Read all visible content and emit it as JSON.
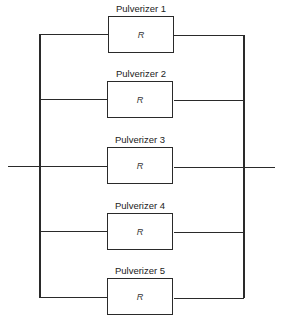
{
  "diagram": {
    "type": "parallel-reliability-block-diagram",
    "blocks": [
      {
        "label": "Pulverizer 1",
        "value": "R"
      },
      {
        "label": "Pulverizer 2",
        "value": "R"
      },
      {
        "label": "Pulverizer 3",
        "value": "R"
      },
      {
        "label": "Pulverizer 4",
        "value": "R"
      },
      {
        "label": "Pulverizer 5",
        "value": "R"
      }
    ]
  }
}
